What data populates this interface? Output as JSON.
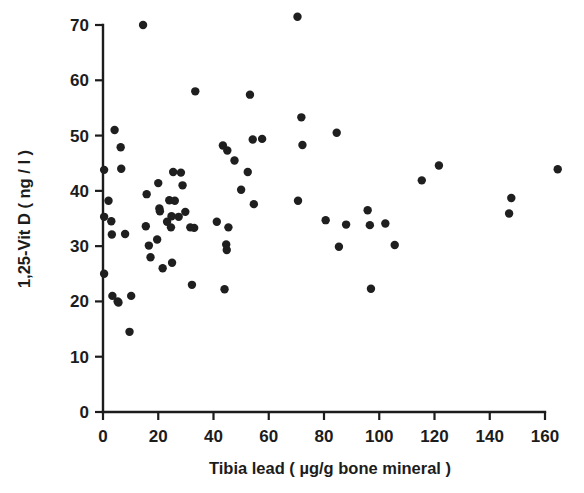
{
  "chart_data": {
    "type": "scatter",
    "title": "",
    "xlabel": "Tibia lead ( µg/g bone mineral )",
    "ylabel": "1,25-Vit D ( ng / l )",
    "xlim": [
      0,
      165
    ],
    "ylim": [
      0,
      72
    ],
    "xticks": [
      0,
      20,
      40,
      60,
      80,
      100,
      120,
      140,
      160
    ],
    "yticks": [
      0,
      10,
      20,
      30,
      40,
      50,
      60,
      70
    ],
    "xtick_labels": [
      "0",
      "20",
      "40",
      "60",
      "80",
      "100",
      "120",
      "140",
      "160"
    ],
    "ytick_labels": [
      "0",
      "10",
      "20",
      "30",
      "40",
      "50",
      "60",
      "70"
    ],
    "grid": false,
    "legend": false,
    "marker": "filled-circle",
    "marker_color": "#1f1f1f",
    "marker_size_px": 5.2,
    "n_points": 72,
    "x": [
      0.4,
      0.4,
      0.4,
      2.0,
      3.0,
      3.2,
      3.4,
      4.2,
      5.3,
      5.6,
      6.4,
      6.6,
      8.0,
      9.6,
      10.2,
      14.5,
      15.5,
      15.8,
      16.6,
      17.2,
      19.6,
      20.0,
      20.4,
      20.6,
      21.6,
      23.2,
      24.0,
      24.6,
      24.8,
      25.0,
      25.4,
      26.0,
      27.4,
      28.2,
      28.8,
      29.8,
      31.6,
      32.2,
      33.0,
      33.4,
      41.2,
      43.4,
      44.0,
      44.6,
      44.8,
      45.0,
      45.4,
      47.6,
      50.0,
      52.4,
      53.2,
      54.2,
      54.6,
      57.6,
      70.4,
      70.6,
      71.8,
      72.2,
      80.6,
      84.6,
      85.4,
      88.0,
      95.8,
      96.6,
      97.0,
      102.2,
      105.6,
      115.4,
      121.6,
      147.0,
      147.8,
      164.6
    ],
    "y": [
      25.0,
      35.3,
      43.8,
      38.2,
      34.5,
      32.1,
      21.0,
      51.0,
      20.0,
      19.8,
      47.9,
      44.0,
      32.2,
      14.5,
      21.0,
      70.0,
      33.6,
      39.4,
      30.1,
      28.0,
      31.2,
      41.4,
      36.8,
      36.3,
      26.0,
      34.4,
      38.3,
      33.4,
      35.4,
      27.0,
      43.4,
      38.2,
      35.3,
      43.3,
      41.0,
      36.2,
      33.4,
      23.0,
      33.3,
      58.0,
      34.4,
      48.2,
      22.2,
      30.3,
      29.3,
      47.3,
      33.4,
      45.5,
      40.2,
      43.4,
      57.4,
      49.3,
      37.6,
      49.4,
      71.5,
      38.2,
      53.3,
      48.3,
      34.7,
      50.5,
      29.9,
      33.9,
      36.5,
      33.8,
      22.3,
      34.1,
      30.2,
      41.9,
      44.6,
      35.9,
      38.7,
      43.9
    ]
  },
  "figure": {
    "caption": "",
    "background": "#ffffff",
    "axis_color": "#1c1c1c"
  }
}
